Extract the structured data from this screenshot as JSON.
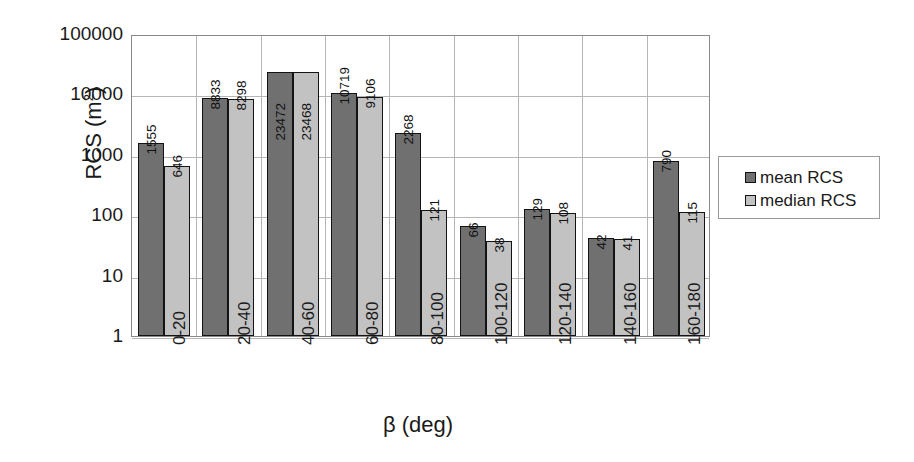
{
  "chart_data": {
    "type": "bar",
    "title": "",
    "xlabel": "β (deg)",
    "ylabel": "RCS (m²)",
    "ylabel_base": "RCS (m",
    "ylabel_sup": "2",
    "ylabel_close": ")",
    "yscale": "log",
    "ylim": [
      1,
      100000
    ],
    "ytick_labels": [
      "100000",
      "10000",
      "1000",
      "100",
      "10",
      "1"
    ],
    "ytick_values": [
      100000,
      10000,
      1000,
      100,
      10,
      1
    ],
    "grid": true,
    "legend_position": "right",
    "categories": [
      "0-20",
      "20-40",
      "40-60",
      "60-80",
      "80-100",
      "100-120",
      "120-140",
      "140-160",
      "160-180"
    ],
    "series": [
      {
        "name": "mean RCS",
        "color": "#707070",
        "values": [
          1555,
          8833,
          23472,
          10719,
          2268,
          66,
          129,
          42,
          790
        ],
        "labels": [
          "1555",
          "8833",
          "23472",
          "10719",
          "2268",
          "66",
          "129",
          "42",
          "790"
        ]
      },
      {
        "name": "median RCS",
        "color": "#c2c2c2",
        "values": [
          646,
          8298,
          23468,
          9106,
          121,
          38,
          108,
          41,
          115
        ],
        "labels": [
          "646",
          "8298",
          "23468",
          "9106",
          "121",
          "38",
          "108",
          "41",
          "115"
        ]
      }
    ]
  },
  "legend": {
    "entries": [
      {
        "label": "mean RCS",
        "color": "#707070"
      },
      {
        "label": "median RCS",
        "color": "#c2c2c2"
      }
    ]
  }
}
